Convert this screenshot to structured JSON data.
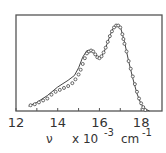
{
  "chart_data": {
    "type": "line",
    "title": "",
    "xlabel": "ν  x 10⁻³  cm⁻¹",
    "xlabel_parts": {
      "symbol": "ν",
      "scale": "x 10",
      "exponent": "-3",
      "unit": "cm",
      "unit_exponent": "-1"
    },
    "ylabel": "",
    "xlim": [
      12,
      19
    ],
    "ylim": [
      0,
      1
    ],
    "xticks": [
      12,
      14,
      16,
      18
    ],
    "x_minor_ticks": [
      13,
      15,
      17
    ],
    "grid": false,
    "legend": null,
    "series": [
      {
        "name": "fit (line)",
        "style": "line",
        "x": [
          12.6,
          13.0,
          13.5,
          14.0,
          14.5,
          14.8,
          15.0,
          15.2,
          15.4,
          15.6,
          15.8,
          16.0,
          16.2,
          16.4,
          16.6,
          16.8,
          17.0,
          17.2,
          17.4,
          17.6,
          17.8,
          18.0,
          18.2,
          18.4
        ],
        "values": [
          0.05,
          0.09,
          0.16,
          0.25,
          0.32,
          0.37,
          0.45,
          0.56,
          0.63,
          0.63,
          0.59,
          0.55,
          0.6,
          0.72,
          0.84,
          0.9,
          0.88,
          0.72,
          0.52,
          0.34,
          0.18,
          0.07,
          0.02,
          0.0
        ]
      },
      {
        "name": "data (circles)",
        "style": "markers",
        "marker": "open-circle",
        "x": [
          12.7,
          12.9,
          13.1,
          13.3,
          13.5,
          13.7,
          13.9,
          14.1,
          14.3,
          14.5,
          14.7,
          14.85,
          15.0,
          15.1,
          15.2,
          15.3,
          15.4,
          15.5,
          15.6,
          15.7,
          15.8,
          15.9,
          16.0,
          16.1,
          16.2,
          16.3,
          16.4,
          16.5,
          16.6,
          16.7,
          16.8,
          16.9,
          17.0,
          17.1,
          17.15,
          17.2,
          17.3,
          17.4,
          17.5,
          17.6,
          17.7,
          17.8,
          17.9,
          18.0,
          18.1,
          18.2
        ],
        "values": [
          0.06,
          0.07,
          0.09,
          0.11,
          0.13,
          0.17,
          0.2,
          0.22,
          0.24,
          0.26,
          0.29,
          0.33,
          0.38,
          0.43,
          0.49,
          0.55,
          0.6,
          0.62,
          0.63,
          0.62,
          0.59,
          0.56,
          0.55,
          0.57,
          0.61,
          0.66,
          0.72,
          0.78,
          0.83,
          0.87,
          0.89,
          0.89,
          0.87,
          0.8,
          0.75,
          0.7,
          0.62,
          0.52,
          0.44,
          0.36,
          0.28,
          0.2,
          0.13,
          0.08,
          0.04,
          0.01
        ]
      }
    ]
  }
}
